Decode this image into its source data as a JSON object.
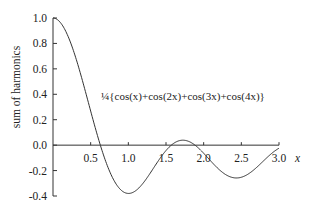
{
  "chart_data": {
    "type": "line",
    "title": "",
    "xlabel": "x",
    "ylabel": "sum of harmonics",
    "xlim": [
      0,
      3.0
    ],
    "ylim": [
      -0.4,
      1.0
    ],
    "grid": false,
    "x_ticks": [
      0.5,
      1.0,
      1.5,
      2.0,
      2.5,
      3.0
    ],
    "x_tick_labels": [
      "0.5",
      "1.0",
      "1.5",
      "2.0",
      "2.5",
      "3.0"
    ],
    "y_ticks": [
      1.0,
      0.8,
      0.6,
      0.4,
      0.2,
      0.0,
      -0.2,
      -0.4
    ],
    "y_tick_labels": [
      "1.0",
      "0.8",
      "0.6",
      "0.4",
      "0.2",
      "0.0",
      "-0.2",
      "-0.4"
    ],
    "annotation": "¼{cos(x)+cos(2x)+cos(3x)+cos(4x)}",
    "series": [
      {
        "name": "¼{cos(x)+cos(2x)+cos(3x)+cos(4x)}",
        "function": "0.25*(cos(x)+cos(2x)+cos(3x)+cos(4x))",
        "x_range": [
          0,
          3.0
        ],
        "sample_points": [
          {
            "x": 0.0,
            "y": 1.0
          },
          {
            "x": 0.5,
            "y": 0.312
          },
          {
            "x": 0.63,
            "y": 0.0
          },
          {
            "x": 1.0,
            "y": -0.364
          },
          {
            "x": 1.5,
            "y": -0.094
          },
          {
            "x": 1.75,
            "y": 0.04
          },
          {
            "x": 2.0,
            "y": -0.01
          },
          {
            "x": 2.5,
            "y": -0.26
          },
          {
            "x": 3.0,
            "y": 0.0
          }
        ]
      }
    ]
  }
}
